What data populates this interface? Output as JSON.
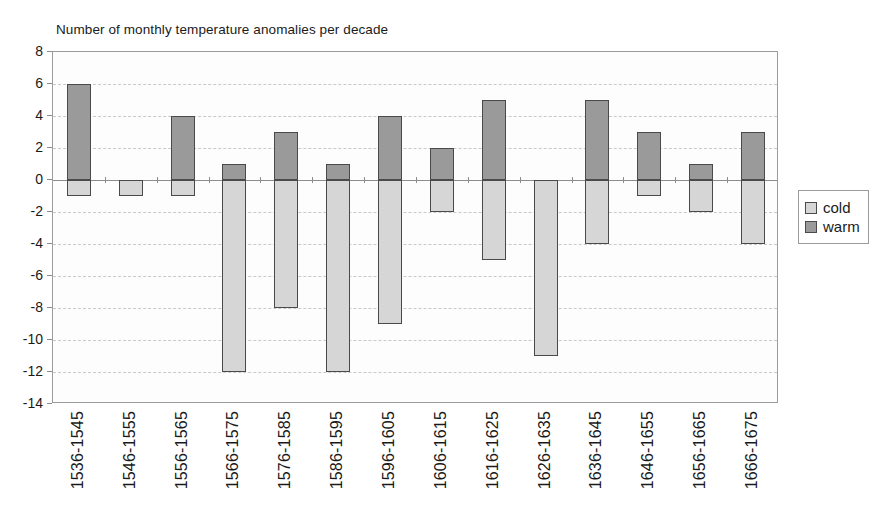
{
  "chart_data": {
    "type": "bar",
    "title": "Number of monthly temperature anomalies per decade",
    "xlabel": "",
    "ylabel": "",
    "ylim": [
      -14,
      8
    ],
    "ytick_step": 2,
    "grid": true,
    "stacked_diverging": true,
    "legend_position": "right",
    "categories": [
      "1536-1545",
      "1546-1555",
      "1556-1565",
      "1566-1575",
      "1576-1585",
      "1586-1595",
      "1596-1605",
      "1606-1615",
      "1616-1625",
      "1626-1635",
      "1636-1645",
      "1646-1655",
      "1656-1665",
      "1666-1675"
    ],
    "yticks": [
      8,
      6,
      4,
      2,
      0,
      -2,
      -4,
      -6,
      -8,
      -10,
      -12,
      -14
    ],
    "ytick_labels": [
      "8",
      "6",
      "4",
      "2",
      "0",
      "-2",
      "-4",
      "-6",
      "-8",
      "-10",
      "-12",
      "-14"
    ],
    "series": [
      {
        "name": "cold",
        "color": "#d6d6d6",
        "values": [
          -1,
          -1,
          -1,
          -12,
          -8,
          -12,
          -9,
          -2,
          -5,
          -11,
          -4,
          -1,
          -2,
          -4
        ]
      },
      {
        "name": "warm",
        "color": "#9a9a9a",
        "values": [
          6,
          0,
          4,
          1,
          3,
          1,
          4,
          2,
          5,
          0,
          5,
          3,
          1,
          3
        ]
      }
    ]
  },
  "legend": {
    "items": [
      {
        "label": "cold",
        "swatch": "cold"
      },
      {
        "label": "warm",
        "swatch": "warm"
      }
    ]
  },
  "colors": {
    "cold": "#d6d6d6",
    "warm": "#9a9a9a",
    "axis": "#8d8d8d",
    "grid": "#c9c9c9",
    "bar_outline": "#4a4a4a",
    "plot_background": "#fdfdfd",
    "page_background": "#ffffff"
  }
}
